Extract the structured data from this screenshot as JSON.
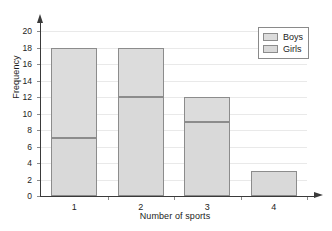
{
  "chart_data": {
    "type": "bar",
    "subtype": "stacked-bar",
    "title": "",
    "xlabel": "Number of sports",
    "ylabel": "Frequency",
    "categories": [
      "1",
      "2",
      "3",
      "4"
    ],
    "series": [
      {
        "name": "Girls",
        "values": [
          7,
          12,
          9,
          3
        ],
        "color": "#d9d9d9"
      },
      {
        "name": "Boys",
        "values": [
          11,
          6,
          3,
          0
        ],
        "color": "#dcdcdc"
      }
    ],
    "totals": [
      18,
      18,
      12,
      3
    ],
    "ylim": [
      0,
      20
    ],
    "ytick_step": 2,
    "yticks": [
      0,
      2,
      4,
      6,
      8,
      10,
      12,
      14,
      16,
      18,
      20
    ],
    "ytick_labels": [
      "0",
      "2",
      "4",
      "6",
      "8",
      "10",
      "12",
      "14",
      "16",
      "18",
      "20"
    ],
    "xticks": [
      "1",
      "2",
      "3",
      "4"
    ],
    "grid": "horizontal",
    "grid_color": "#e9e9e9",
    "legend": {
      "position": "top-right",
      "entries": [
        {
          "label": "Boys",
          "color": "#dcdcdc"
        },
        {
          "label": "Girls",
          "color": "#d9d9d9"
        }
      ]
    },
    "axis_style": "arrow-tipped",
    "axis_color": "#3a3a3a",
    "bar_border_color": "#8c8c8c"
  }
}
